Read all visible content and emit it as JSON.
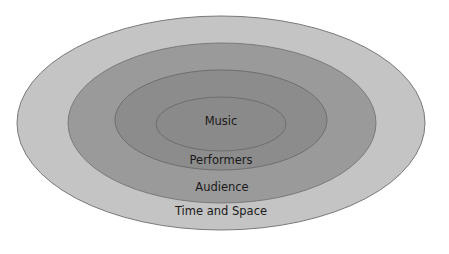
{
  "diagram": {
    "type": "nested-ellipses",
    "layers": [
      {
        "label": "Time and Space",
        "fill": "#c4c4c4",
        "stroke": "#7a7a7a",
        "cx": 221,
        "cy": 123,
        "rx": 204,
        "ry": 107,
        "label_y": 215
      },
      {
        "label": "Audience",
        "fill": "#9a9a9a",
        "stroke": "#7a7a7a",
        "cx": 222,
        "cy": 123,
        "rx": 154,
        "ry": 80,
        "label_y": 191
      },
      {
        "label": "Performers",
        "fill": "#8c8c8c",
        "stroke": "#6e6e6e",
        "cx": 221,
        "cy": 120,
        "rx": 106,
        "ry": 50,
        "label_y": 164
      },
      {
        "label": "Music",
        "fill": "#8a8a8a",
        "stroke": "#6e6e6e",
        "cx": 221,
        "cy": 124,
        "rx": 65,
        "ry": 27,
        "label_y": 125
      }
    ]
  }
}
